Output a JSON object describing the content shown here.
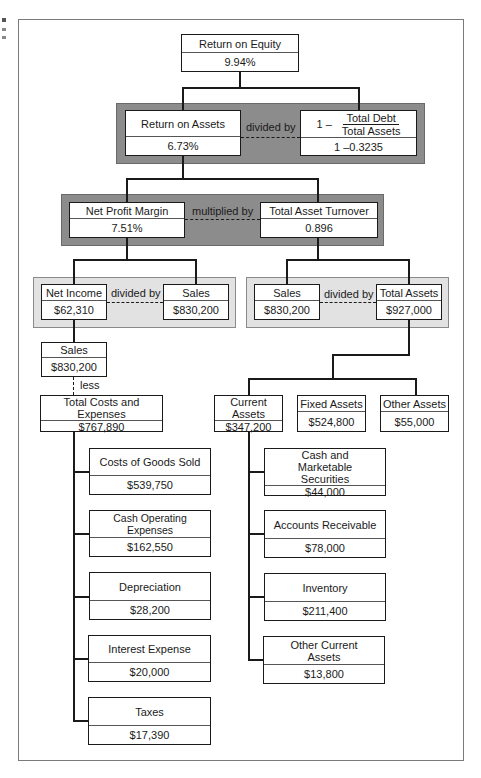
{
  "roe": {
    "label": "Return on Equity",
    "value": "9.94%"
  },
  "band1": {
    "roa": {
      "label": "Return on Assets",
      "value": "6.73%"
    },
    "operator": "divided by",
    "debt": {
      "prefix": "1 –",
      "numerator": "Total Debt",
      "denominator": "Total Assets",
      "value": "1 –0.3235"
    }
  },
  "band2": {
    "npm": {
      "label": "Net Profit Margin",
      "value": "7.51%"
    },
    "operator": "multiplied by",
    "tat": {
      "label": "Total Asset Turnover",
      "value": "0.896"
    }
  },
  "band3_left": {
    "net_income": {
      "label": "Net Income",
      "value": "$62,310"
    },
    "operator": "divided by",
    "sales": {
      "label": "Sales",
      "value": "$830,200"
    }
  },
  "band3_right": {
    "sales": {
      "label": "Sales",
      "value": "$830,200"
    },
    "operator": "divided by",
    "total_assets": {
      "label": "Total Assets",
      "value": "$927,000"
    }
  },
  "income_side": {
    "sales": {
      "label": "Sales",
      "value": "$830,200"
    },
    "operator": "less",
    "total_costs": {
      "label": "Total Costs and Expenses",
      "value": "$767,890"
    },
    "expenses": [
      {
        "label": "Costs of Goods Sold",
        "value": "$539,750"
      },
      {
        "label": "Cash Operating Expenses",
        "value": "$162,550"
      },
      {
        "label": "Depreciation",
        "value": "$28,200"
      },
      {
        "label": "Interest Expense",
        "value": "$20,000"
      },
      {
        "label": "Taxes",
        "value": "$17,390"
      }
    ]
  },
  "asset_side": {
    "current": {
      "label": "Current Assets",
      "value": "$347,200"
    },
    "fixed": {
      "label": "Fixed Assets",
      "value": "$524,800"
    },
    "other": {
      "label": "Other Assets",
      "value": "$55,000"
    },
    "current_items": [
      {
        "label": "Cash and Marketable Securities",
        "value": "$44,000"
      },
      {
        "label": "Accounts Receivable",
        "value": "$78,000"
      },
      {
        "label": "Inventory",
        "value": "$211,400"
      },
      {
        "label": "Other Current Assets",
        "value": "$13,800"
      }
    ]
  }
}
